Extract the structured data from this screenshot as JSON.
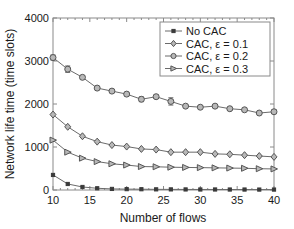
{
  "chart_data": {
    "type": "line",
    "title": "",
    "xlabel": "Number of flows",
    "ylabel": "Network life time (time slots)",
    "xlim": [
      10,
      40
    ],
    "ylim": [
      0,
      4000
    ],
    "xticks": [
      10,
      15,
      20,
      25,
      30,
      35,
      40
    ],
    "yticks": [
      0,
      1000,
      2000,
      3000,
      4000
    ],
    "xticklabels": [
      "10",
      "15",
      "20",
      "25",
      "30",
      "35",
      "40"
    ],
    "yticklabels": [
      "0",
      "1000",
      "2000",
      "3000",
      "4000"
    ],
    "grid": false,
    "legend_position": "upper right",
    "x": [
      10,
      12,
      14,
      16,
      18,
      20,
      22,
      24,
      26,
      28,
      30,
      32,
      34,
      36,
      38,
      40
    ],
    "series": [
      {
        "name": "No CAC",
        "marker": "filled-square",
        "values": [
          350,
          140,
          70,
          40,
          25,
          20,
          18,
          15,
          14,
          13,
          12,
          12,
          11,
          11,
          10,
          10
        ],
        "errors": [
          0,
          0,
          0,
          0,
          0,
          0,
          0,
          0,
          0,
          0,
          0,
          0,
          0,
          0,
          0,
          0
        ]
      },
      {
        "name": "CAC, ε = 0.1",
        "marker": "diamond",
        "values": [
          1755,
          1470,
          1250,
          1125,
          1045,
          1010,
          955,
          940,
          880,
          880,
          880,
          840,
          830,
          810,
          790,
          770
        ],
        "errors": [
          0,
          0,
          0,
          0,
          0,
          0,
          0,
          0,
          0,
          0,
          0,
          0,
          0,
          0,
          0,
          0
        ]
      },
      {
        "name": "CAC, ε = 0.2",
        "marker": "circle",
        "values": [
          3080,
          2810,
          2620,
          2370,
          2300,
          2230,
          2110,
          2170,
          2060,
          1950,
          1925,
          1950,
          1890,
          1865,
          1790,
          1820
        ],
        "errors": [
          60,
          75,
          40,
          35,
          35,
          40,
          55,
          40,
          85,
          25,
          20,
          20,
          20,
          20,
          25,
          45
        ]
      },
      {
        "name": "CAC, ε = 0.3",
        "marker": "right-triangle",
        "values": [
          1160,
          880,
          740,
          660,
          610,
          580,
          545,
          540,
          530,
          525,
          520,
          515,
          510,
          505,
          495,
          490
        ],
        "errors": [
          0,
          0,
          0,
          0,
          0,
          0,
          0,
          0,
          0,
          0,
          0,
          0,
          0,
          0,
          0,
          0
        ]
      }
    ],
    "colors": {
      "line": "#6b6b6b",
      "marker_fill": "#b8b8b8",
      "marker_stroke": "#555555",
      "axis": "#8a8a8a",
      "text": "#1a1a1a"
    }
  }
}
